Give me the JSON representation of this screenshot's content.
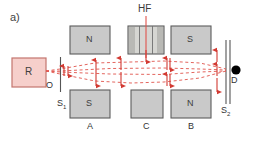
{
  "figure": {
    "panel_label": "a)",
    "title_hf": "HF",
    "caption_note": ""
  },
  "colors": {
    "source_fill": "#f6cfcb",
    "source_stroke": "#c4756e",
    "magnet_fill": "#c9c9c9",
    "magnet_stroke": "#5c5c5c",
    "beam": "#e0544c",
    "arrow": "#d23a32",
    "detector": "#000000",
    "slit": "#555555",
    "text": "#3a3a3a"
  },
  "source": {
    "name": "oven-source",
    "label": "R",
    "exit_label": "O"
  },
  "slits": [
    {
      "name": "slit-one",
      "label": "S",
      "sub": "1"
    },
    {
      "name": "slit-two",
      "label": "S",
      "sub": "2"
    }
  ],
  "detector": {
    "name": "detector",
    "label": "D"
  },
  "magnets": [
    {
      "id": "A-top",
      "pole": "N",
      "position": "top",
      "group": "A"
    },
    {
      "id": "A-bottom",
      "pole": "S",
      "position": "bottom",
      "group": "A"
    },
    {
      "id": "C-top",
      "pole": "",
      "position": "top",
      "group": "C"
    },
    {
      "id": "C-bottom",
      "pole": "",
      "position": "bottom",
      "group": "C"
    },
    {
      "id": "B-top",
      "pole": "S",
      "position": "top",
      "group": "B"
    },
    {
      "id": "B-bottom",
      "pole": "N",
      "position": "bottom",
      "group": "B"
    }
  ],
  "group_labels": [
    {
      "label": "A"
    },
    {
      "label": "C"
    },
    {
      "label": "B"
    }
  ],
  "rf_region": {
    "name": "rf-transition-region",
    "label": "HF"
  },
  "beam_paths": {
    "description": "two dashed red trajectories diverging from source, refocused at detector",
    "style": "dashed"
  },
  "spin_arrows": {
    "count": 14,
    "direction_set": [
      "up",
      "down"
    ]
  }
}
